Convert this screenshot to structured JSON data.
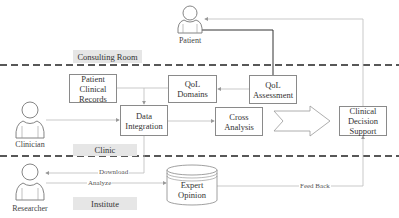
{
  "diagram": {
    "zones": [
      {
        "id": "consulting-room",
        "label": "Consulting Room"
      },
      {
        "id": "clinic",
        "label": "Clinic"
      },
      {
        "id": "institute",
        "label": "Institute"
      }
    ],
    "actors": {
      "patient": {
        "label": "Patient",
        "icon": "person-icon"
      },
      "clinician": {
        "label": "Clinician",
        "icon": "person-icon"
      },
      "researcher": {
        "label": "Researcher",
        "icon": "person-icon"
      }
    },
    "nodes": {
      "patient_clinical_records": {
        "line1": "Patient",
        "line2": "Clinical",
        "line3": "Records"
      },
      "qol_domains": {
        "line1": "QoL",
        "line2": "Domains"
      },
      "qol_assessment": {
        "line1": "QoL",
        "line2": "Assessment"
      },
      "data_integration": {
        "line1": "Data",
        "line2": "Integration"
      },
      "cross_analysis": {
        "line1": "Cross",
        "line2": "Analysis"
      },
      "clinical_decision_support": {
        "line1": "Clinical",
        "line2": "Decision",
        "line3": "Support"
      },
      "expert_opinion": {
        "line1": "Expert",
        "line2": "Opinion",
        "shape": "database-cylinder"
      }
    },
    "edge_labels": {
      "download": "Download",
      "analyze": "Analyze",
      "feed_back": "Feed Back"
    },
    "colors": {
      "line": "#b0b0b0",
      "dark_line": "#333333",
      "box_border": "#8a8a8a",
      "zone_label_bg": "#e6e6e6",
      "divider": "#222222"
    }
  }
}
